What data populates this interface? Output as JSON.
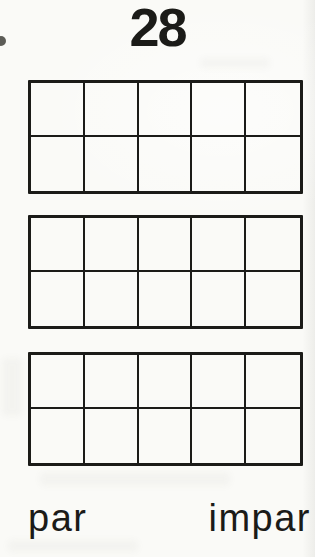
{
  "document": {
    "title": "28",
    "frames": [
      {
        "id": "ten-frame-1",
        "rows": 2,
        "cols": 5,
        "filled": 0
      },
      {
        "id": "ten-frame-2",
        "rows": 2,
        "cols": 5,
        "filled": 0
      },
      {
        "id": "ten-frame-3",
        "rows": 2,
        "cols": 5,
        "filled": 0
      }
    ],
    "answer_labels": {
      "even": "par",
      "odd": "impar"
    },
    "colors": {
      "ink": "#1b1b18",
      "paper": "#fafaf7"
    }
  }
}
